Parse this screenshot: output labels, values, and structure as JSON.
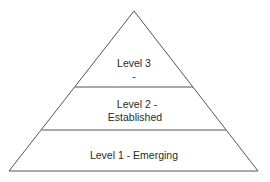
{
  "diagram": {
    "type": "pyramid",
    "stroke_color": "#555555",
    "fill_color": "#ffffff",
    "text_color": "#2b2b2b",
    "levels": [
      {
        "id": "level-3",
        "position": "top",
        "line1": "Level 3",
        "line2": "-"
      },
      {
        "id": "level-2",
        "position": "middle",
        "line1": "Level 2 -",
        "line2": "Established"
      },
      {
        "id": "level-1",
        "position": "bottom",
        "line1": "Level 1 - Emerging"
      }
    ]
  }
}
